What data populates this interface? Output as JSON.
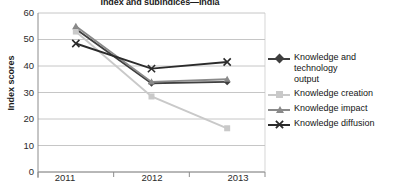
{
  "chart_data": {
    "type": "line",
    "title": "Index and subindices—India",
    "xlabel": "",
    "ylabel": "Index scores",
    "categories": [
      "2011",
      "2012",
      "2013"
    ],
    "x": [
      2011,
      2012,
      2013
    ],
    "ylim": [
      0,
      60
    ],
    "yticks": [
      0,
      10,
      20,
      30,
      40,
      50,
      60
    ],
    "grid": true,
    "legend_position": "right",
    "series": [
      {
        "name": "Knowledge and technology output",
        "values": [
          54,
          33.5,
          34
        ],
        "color": "#3f3f3f",
        "marker": "diamond"
      },
      {
        "name": "Knowledge creation",
        "values": [
          53,
          28.5,
          16.5
        ],
        "color": "#c9c9c9",
        "marker": "square"
      },
      {
        "name": "Knowledge impact",
        "values": [
          55,
          34,
          35
        ],
        "color": "#8a8a8a",
        "marker": "triangle"
      },
      {
        "name": "Knowledge diffusion",
        "values": [
          48.5,
          39,
          41.5
        ],
        "color": "#2b2b2b",
        "marker": "x"
      }
    ]
  },
  "axis": {
    "ytick_labels": [
      "60",
      "50",
      "40",
      "30",
      "20",
      "10",
      "0"
    ],
    "xtick_labels": [
      "2011",
      "2012",
      "2013"
    ],
    "y_axis_title": "Index scores"
  },
  "legend": {
    "entries": [
      {
        "label_line1": "Knowledge and technology",
        "label_line2": "output"
      },
      {
        "label_line1": "Knowledge creation",
        "label_line2": ""
      },
      {
        "label_line1": "Knowledge impact",
        "label_line2": ""
      },
      {
        "label_line1": "Knowledge diffusion",
        "label_line2": ""
      }
    ]
  }
}
